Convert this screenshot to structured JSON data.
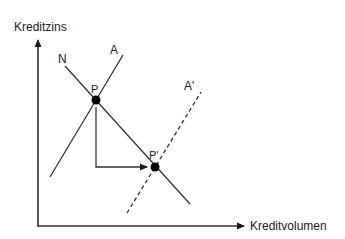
{
  "diagram": {
    "axes": {
      "y_label": "Kreditzins",
      "x_label": "Kreditvolumen"
    },
    "curves": [
      {
        "id": "N",
        "label": "N",
        "style": "solid",
        "description": "Kreditnachfrage"
      },
      {
        "id": "A",
        "label": "A",
        "style": "solid",
        "description": "Kreditangebot"
      },
      {
        "id": "A_prime",
        "label": "A'",
        "style": "dashed",
        "description": "Verschobenes Kreditangebot"
      }
    ],
    "points": [
      {
        "id": "P",
        "label": "P"
      },
      {
        "id": "P_prime",
        "label": "P'"
      }
    ],
    "colors": {
      "line": "#333333",
      "point": "#000000",
      "background": "#ffffff"
    }
  }
}
